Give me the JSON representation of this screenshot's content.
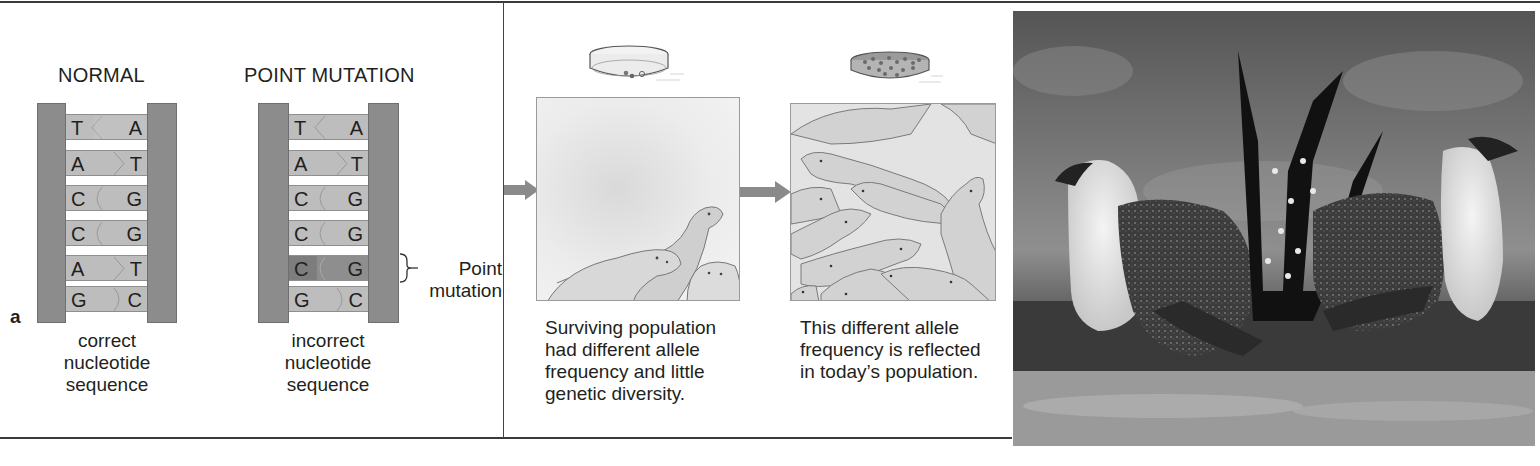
{
  "figure": {
    "panel_letter": "a",
    "panels": [
      {
        "id": "point-mutation",
        "helices": [
          {
            "title": "NORMAL",
            "pairs": [
              {
                "left": "T",
                "right": "A",
                "mutated": false
              },
              {
                "left": "A",
                "right": "T",
                "mutated": false
              },
              {
                "left": "C",
                "right": "G",
                "mutated": false
              },
              {
                "left": "C",
                "right": "G",
                "mutated": false
              },
              {
                "left": "A",
                "right": "T",
                "mutated": false
              },
              {
                "left": "G",
                "right": "C",
                "mutated": false
              }
            ],
            "caption": [
              "correct",
              "nucleotide",
              "sequence"
            ]
          },
          {
            "title": "POINT MUTATION",
            "pairs": [
              {
                "left": "T",
                "right": "A",
                "mutated": false
              },
              {
                "left": "A",
                "right": "T",
                "mutated": false
              },
              {
                "left": "C",
                "right": "G",
                "mutated": false
              },
              {
                "left": "C",
                "right": "G",
                "mutated": false
              },
              {
                "left": "C",
                "right": "G",
                "mutated": true
              },
              {
                "left": "G",
                "right": "C",
                "mutated": false
              }
            ],
            "caption": [
              "incorrect",
              "nucleotide",
              "sequence"
            ],
            "annotation": [
              "Point",
              "mutation"
            ]
          }
        ]
      },
      {
        "id": "genetic-drift-seals",
        "stages": [
          {
            "dish": "few-colonies",
            "caption": [
              "Surviving population",
              "had different allele",
              "frequency and little",
              "genetic diversity."
            ]
          },
          {
            "dish": "many-colonies",
            "caption": [
              "This different allele",
              "frequency is reflected",
              "in today’s population."
            ]
          }
        ]
      },
      {
        "id": "sage-grouse-photo",
        "description": "black-and-white photograph of two displaying male sage grouse"
      }
    ]
  },
  "colors": {
    "backbone": "#8c8c8c",
    "rung": "#bdbdbd",
    "rung_mutated": "#8e8e8e",
    "arrow": "#8a8a8a",
    "rule": "#3a3a3a",
    "text": "#231f20"
  }
}
